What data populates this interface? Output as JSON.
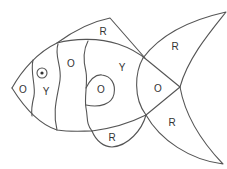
{
  "diagram": {
    "type": "color-by-letter fish",
    "stroke_color": "#555555",
    "label_color": "#333333",
    "regions": [
      {
        "id": "head",
        "label": "O",
        "x": 23,
        "y": 89
      },
      {
        "id": "stripe-1",
        "label": "Y",
        "x": 46,
        "y": 91
      },
      {
        "id": "stripe-2",
        "label": "O",
        "x": 71,
        "y": 63
      },
      {
        "id": "body-middle",
        "label": "Y",
        "x": 122,
        "y": 67
      },
      {
        "id": "spot",
        "label": "O",
        "x": 101,
        "y": 89
      },
      {
        "id": "rear-body",
        "label": "O",
        "x": 158,
        "y": 88
      },
      {
        "id": "top-fin",
        "label": "R",
        "x": 103,
        "y": 31
      },
      {
        "id": "bottom-fin",
        "label": "R",
        "x": 112,
        "y": 137
      },
      {
        "id": "tail-upper",
        "label": "R",
        "x": 175,
        "y": 46
      },
      {
        "id": "tail-lower",
        "label": "R",
        "x": 172,
        "y": 122
      }
    ],
    "eye": {
      "cx": 42,
      "cy": 73,
      "r": 5,
      "pupil_r": 1.6
    }
  }
}
